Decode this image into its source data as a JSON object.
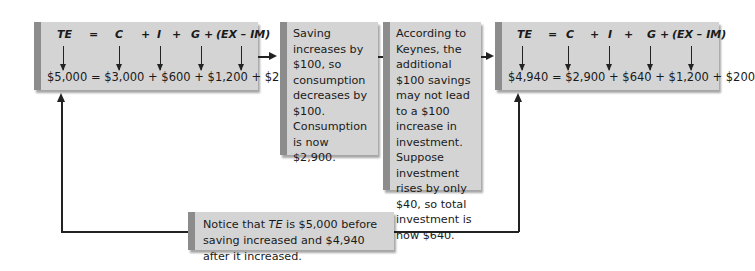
{
  "equation_labels": {
    "te": "TE",
    "eq": "=",
    "c": "C",
    "plus1": "+",
    "i": "I",
    "plus2": "+",
    "g": "G",
    "plus3": "+",
    "net_exports": "(EX – IM)"
  },
  "before": {
    "values": "$5,000 = $3,000 + $600 + $1,200 + $200",
    "te": 5000,
    "c": 3000,
    "i": 600,
    "g": 1200,
    "net_exports": 200
  },
  "step1": {
    "text": "Saving increases by $100, so consumption decreases by $100. Consumption is now $2,900."
  },
  "step2": {
    "text": "According to Keynes, the additional $100 savings may not lead to a $100 increase in investment. Suppose investment rises by only $40, so total investment is now $640."
  },
  "after": {
    "values": "$4,940 = $2,900 + $640 + $1,200 + $200",
    "te": 4940,
    "c": 2900,
    "i": 640,
    "g": 1200,
    "net_exports": 200
  },
  "note": {
    "prefix": "Notice that ",
    "te": "TE",
    "suffix": " is $5,000 before saving increased and $4,940 after it increased."
  },
  "colors": {
    "box_fill": "#d4d4d4",
    "box_edge": "#8c8c8c",
    "line": "#222222"
  }
}
